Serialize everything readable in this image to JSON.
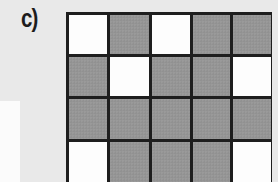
{
  "figure": {
    "label": "c)",
    "grid": {
      "rows": 4,
      "columns": 5,
      "cells": [
        [
          "white",
          "gray",
          "white",
          "gray",
          "gray"
        ],
        [
          "gray",
          "white",
          "gray",
          "gray",
          "white"
        ],
        [
          "gray",
          "gray",
          "gray",
          "gray",
          "gray"
        ],
        [
          "white",
          "gray",
          "gray",
          "gray",
          "white"
        ]
      ],
      "counts": {
        "white": 6,
        "gray": 14,
        "total": 20
      },
      "colors": {
        "white": "#fdfdfd",
        "gray": "#959595",
        "border": "#1e1e1e",
        "background": "#e9e9e9"
      }
    }
  }
}
